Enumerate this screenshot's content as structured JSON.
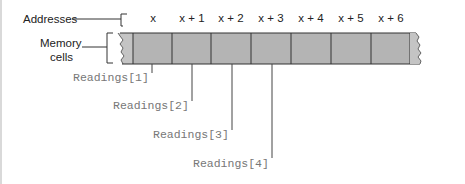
{
  "labels": {
    "addresses": "Addresses",
    "memory_line1": "Memory",
    "memory_line2": "cells"
  },
  "addresses": [
    "x",
    "x + 1",
    "x + 2",
    "x + 3",
    "x + 4",
    "x + 5",
    "x + 6"
  ],
  "readings": [
    "Readings[1]",
    "Readings[2]",
    "Readings[3]",
    "Readings[4]"
  ],
  "colors": {
    "cell_fill": "#b4b4b4",
    "cell_border": "#333333",
    "reading_text": "#777777",
    "label_text": "#222222"
  }
}
